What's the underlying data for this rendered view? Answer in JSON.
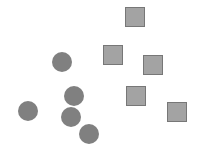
{
  "figure": {
    "background_color": "#ffffff",
    "width": 197,
    "height": 154
  },
  "chart_data": {
    "type": "scatter",
    "title": "",
    "subtitle": "",
    "xlabel": "",
    "ylabel": "",
    "xlim": [
      0,
      197
    ],
    "ylim": [
      0,
      154
    ],
    "grid": false,
    "axes_visible": false,
    "tick_labels_visible": false,
    "legend": null,
    "legend_position": "none",
    "series": [
      {
        "name": "circles",
        "marker": "circle",
        "marker_size": 20,
        "fill_color": "#808080",
        "edge_color": "#808080",
        "edge_width": 0,
        "count": 5,
        "points": [
          {
            "x": 62,
            "y": 62
          },
          {
            "x": 74,
            "y": 96
          },
          {
            "x": 71,
            "y": 117
          },
          {
            "x": 89,
            "y": 134
          },
          {
            "x": 28,
            "y": 111
          }
        ]
      },
      {
        "name": "squares",
        "marker": "square",
        "marker_size": 20,
        "fill_color": "#a3a3a3",
        "edge_color": "#777777",
        "edge_width": 1,
        "count": 5,
        "points": [
          {
            "x": 135,
            "y": 17
          },
          {
            "x": 113,
            "y": 55
          },
          {
            "x": 153,
            "y": 65
          },
          {
            "x": 136,
            "y": 96
          },
          {
            "x": 177,
            "y": 112
          }
        ]
      }
    ]
  }
}
